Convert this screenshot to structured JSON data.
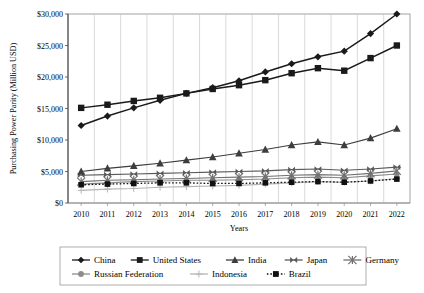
{
  "chart_data": {
    "type": "line",
    "title": "",
    "xlabel": "Years",
    "ylabel": "Purchasing Power Parity (Million USD)",
    "x": [
      2010,
      2011,
      2012,
      2013,
      2014,
      2015,
      2016,
      2017,
      2018,
      2019,
      2020,
      2021,
      2022
    ],
    "xtick_labels": [
      "2010",
      "2011",
      "2012",
      "2013",
      "2014",
      "2015",
      "2016",
      "2017",
      "2018",
      "2019",
      "2020",
      "2021",
      "2022"
    ],
    "ytick_labels": [
      "$0",
      "$5,000",
      "$10,000",
      "$15,000",
      "$20,000",
      "$25,000",
      "$30,000"
    ],
    "ytick_values": [
      0,
      5000,
      10000,
      15000,
      20000,
      25000,
      30000
    ],
    "ylim": [
      0,
      30000
    ],
    "grid": "vertical",
    "legend_position": "bottom",
    "series": [
      {
        "name": "China",
        "marker": "diamond",
        "color": "#1a1a1a",
        "linestyle": "solid",
        "values": [
          12300,
          13800,
          15100,
          16300,
          17400,
          18300,
          19400,
          20800,
          22100,
          23200,
          24100,
          26900,
          30000
        ]
      },
      {
        "name": "United States",
        "marker": "square",
        "color": "#1a1a1a",
        "linestyle": "solid",
        "values": [
          15100,
          15600,
          16200,
          16700,
          17400,
          18100,
          18700,
          19500,
          20600,
          21400,
          21000,
          23000,
          25000
        ]
      },
      {
        "name": "India",
        "marker": "triangle",
        "color": "#3d3d3d",
        "linestyle": "solid",
        "values": [
          5000,
          5500,
          5900,
          6300,
          6800,
          7300,
          7900,
          8500,
          9200,
          9700,
          9200,
          10300,
          11800
        ]
      },
      {
        "name": "Japan",
        "marker": "bowtie",
        "color": "#5a5a5a",
        "linestyle": "solid",
        "values": [
          4400,
          4500,
          4600,
          4700,
          4800,
          4900,
          5000,
          5100,
          5300,
          5400,
          5200,
          5400,
          5700
        ]
      },
      {
        "name": "Germany",
        "marker": "star",
        "color": "#707070",
        "linestyle": "solid",
        "values": [
          3400,
          3600,
          3700,
          3800,
          3900,
          4000,
          4100,
          4200,
          4400,
          4500,
          4400,
          4700,
          5100
        ]
      },
      {
        "name": "Russian Federation",
        "marker": "circle",
        "color": "#8c8c8c",
        "linestyle": "solid",
        "values": [
          3000,
          3200,
          3400,
          3500,
          3600,
          3600,
          3700,
          3800,
          4000,
          4100,
          4000,
          4300,
          4600
        ]
      },
      {
        "name": "Indonesia",
        "marker": "plus",
        "color": "#b5b5b5",
        "linestyle": "solid",
        "values": [
          2000,
          2200,
          2300,
          2500,
          2600,
          2700,
          2800,
          3000,
          3200,
          3400,
          3300,
          3500,
          3900
        ]
      },
      {
        "name": "Brazil",
        "marker": "square",
        "color": "#111111",
        "linestyle": "dotted",
        "values": [
          2900,
          3000,
          3100,
          3200,
          3200,
          3100,
          3100,
          3200,
          3300,
          3400,
          3300,
          3500,
          3800
        ]
      }
    ]
  },
  "legend": {
    "row1": [
      "China",
      "United States",
      "India",
      "Japan",
      "Germany"
    ],
    "row2": [
      "Russian Federation",
      "Indonesia",
      "Brazil"
    ]
  }
}
